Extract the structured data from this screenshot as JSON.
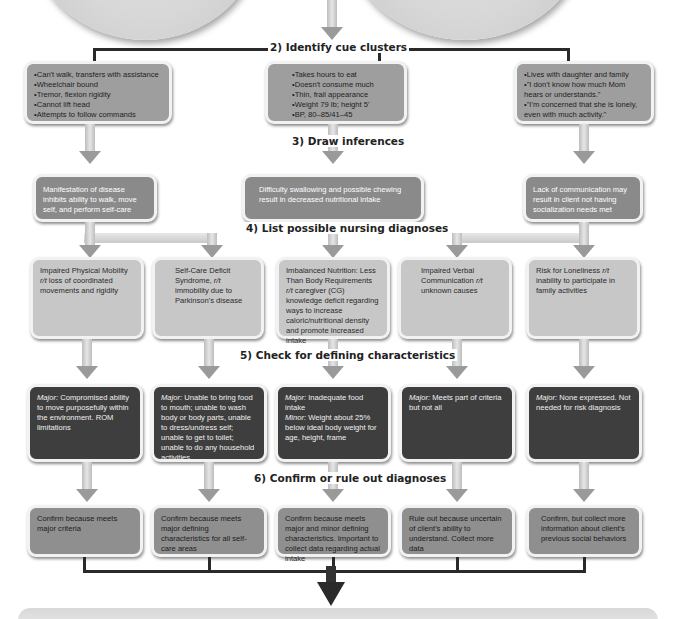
{
  "steps": {
    "step2": "2) Identify cue clusters",
    "step3": "3) Draw inferences",
    "step4": "4) List possible nursing diagnoses",
    "step5": "5) Check for defining characteristics",
    "step6": "6) Confirm or rule out diagnoses"
  },
  "cue_clusters": [
    {
      "items": [
        "Can't walk, transfers with assistance",
        "Wheelchair bound",
        "Tremor, flexion rigidity",
        "Cannot lift head",
        "Attempts to follow commands"
      ]
    },
    {
      "items": [
        "Takes hours to eat",
        "Doesn't consume much",
        "Thin, frail appearance",
        "Weight 79 lb; height 5'",
        "BP, 80–85/41–45"
      ]
    },
    {
      "items": [
        "Lives with daughter and family",
        "\"I don't know how much Mom hears or understands.\"",
        "\"I'm concerned that she is lonely, even with much activity.\""
      ]
    }
  ],
  "inferences": [
    "Manifestation of disease inhibits ability to walk, move self, and perform self-care",
    "Difficulty swallowing and possible chewing result in decreased nutritional intake",
    "Lack of communication may result in client not having socialization needs met"
  ],
  "diagnoses": [
    {
      "pre": "Impaired Physical Mobility ",
      "rt": "r/t",
      "post": " loss of coordinated movements and rigidity"
    },
    {
      "pre": "Self-Care Deficit Syndrome, ",
      "rt": "r/t",
      "post": " immobility due to Parkinson's disease"
    },
    {
      "pre": "Imbalanced Nutrition: Less Than Body Requirements ",
      "rt": "r/t",
      "post": " caregiver (CG) knowledge deficit regarding ways to increase caloric/nutritional density and promote increased intake"
    },
    {
      "pre": "Impaired Verbal Communication ",
      "rt": "r/t",
      "post": " unknown causes"
    },
    {
      "pre": "Risk for Loneliness ",
      "rt": "r/t",
      "post": " inability to participate in family activities"
    }
  ],
  "characteristics": [
    {
      "major_label": "Major:",
      "major": " Compromised ability to move purposefully within the environment. ROM limitations",
      "minor_label": "",
      "minor": ""
    },
    {
      "major_label": "Major:",
      "major": " Unable to bring food to mouth; unable to wash body or body parts, unable to dress/undress self; unable to get to toilet; unable to do any household activities",
      "minor_label": "",
      "minor": ""
    },
    {
      "major_label": "Major:",
      "major": " Inadequate food intake",
      "minor_label": "Minor:",
      "minor": " Weight about 25% below ideal body weight for age, height, frame"
    },
    {
      "major_label": "Major:",
      "major": " Meets part of criteria but not all",
      "minor_label": "",
      "minor": ""
    },
    {
      "major_label": "Major:",
      "major": " None expressed. Not needed for risk diagnosis",
      "minor_label": "",
      "minor": ""
    }
  ],
  "conclusions": [
    "Confirm because meets major criteria",
    "Confirm because meets major defining characteristics for all self-care areas",
    "Confirm because meets major and minor defining characteristics. Important to collect data regarding actual intake",
    "Rule out because uncertain of client's ability to understand. Collect more data",
    "Confirm, but collect more information about client's previous social behaviors"
  ],
  "colors": {
    "inference_box": "#8a8a8a",
    "cue_box": "#9e9e9e",
    "diagnosis_box": "#c7c7c7",
    "characteristic_box": "#3e3e3e",
    "conclusion_box": "#8f8f8f",
    "connector": "#2a2a2a"
  }
}
